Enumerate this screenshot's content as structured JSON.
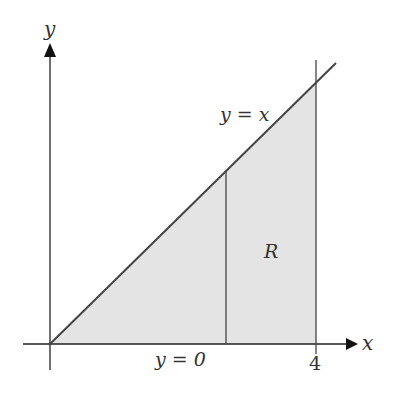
{
  "diagram": {
    "type": "region-plot",
    "axes": {
      "x_label": "x",
      "y_label": "y",
      "x_tick": "4"
    },
    "curves": {
      "upper": "y = x",
      "lower": "y = 0"
    },
    "region_label": "R",
    "colors": {
      "shade": "#e4e4e4",
      "line": "#444444",
      "axis": "#222222"
    }
  }
}
